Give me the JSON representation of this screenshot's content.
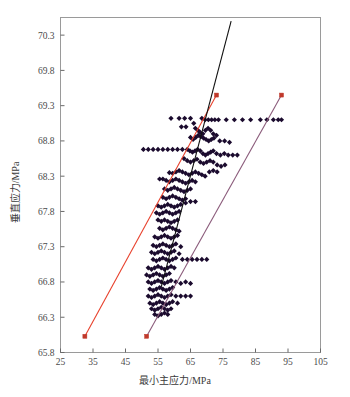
{
  "chart_data": {
    "type": "scatter",
    "title": "",
    "xlabel": "最小主应力/MPa",
    "ylabel": "垂直应力/MPa",
    "xlim": [
      25,
      105
    ],
    "ylim": [
      65.8,
      70.55
    ],
    "xticks": [
      25,
      35,
      45,
      55,
      65,
      75,
      85,
      95,
      105
    ],
    "yticks": [
      65.8,
      66.3,
      66.8,
      67.3,
      67.8,
      68.3,
      68.8,
      69.3,
      69.8,
      70.3
    ],
    "grid": false,
    "legend": "none",
    "marker": {
      "shape": "diamond",
      "color": "#1b0b2e",
      "size": 2.6
    },
    "series": [
      {
        "name": "散点数据",
        "type": "scatter",
        "color": "#1b0b2e",
        "points": [
          [
            59.0,
            69.12
          ],
          [
            61.5,
            69.12
          ],
          [
            63.2,
            69.12
          ],
          [
            65.0,
            69.12
          ],
          [
            68.5,
            69.12
          ],
          [
            62.2,
            69.0
          ],
          [
            63.6,
            69.0
          ],
          [
            66.0,
            69.05
          ],
          [
            69.5,
            69.1
          ],
          [
            70.5,
            69.1
          ],
          [
            71.5,
            69.1
          ],
          [
            72.5,
            69.1
          ],
          [
            73.6,
            69.1
          ],
          [
            76.0,
            69.1
          ],
          [
            78.5,
            69.1
          ],
          [
            81.0,
            69.1
          ],
          [
            83.5,
            69.1
          ],
          [
            86.5,
            69.1
          ],
          [
            88.5,
            69.1
          ],
          [
            90.5,
            69.1
          ],
          [
            92.0,
            69.1
          ],
          [
            93.0,
            69.1
          ],
          [
            66.5,
            68.98
          ],
          [
            67.3,
            68.95
          ],
          [
            68.0,
            68.92
          ],
          [
            68.8,
            68.9
          ],
          [
            69.6,
            68.95
          ],
          [
            70.4,
            68.98
          ],
          [
            71.2,
            68.95
          ],
          [
            72.0,
            68.9
          ],
          [
            73.0,
            68.88
          ],
          [
            65.0,
            68.85
          ],
          [
            65.8,
            68.82
          ],
          [
            66.6,
            68.85
          ],
          [
            67.4,
            68.88
          ],
          [
            68.2,
            68.86
          ],
          [
            69.0,
            68.84
          ],
          [
            69.8,
            68.82
          ],
          [
            70.6,
            68.8
          ],
          [
            71.4,
            68.82
          ],
          [
            72.2,
            68.84
          ],
          [
            74.0,
            68.8
          ],
          [
            75.5,
            68.8
          ],
          [
            77.0,
            68.78
          ],
          [
            50.5,
            68.68
          ],
          [
            52.0,
            68.68
          ],
          [
            53.5,
            68.68
          ],
          [
            55.0,
            68.68
          ],
          [
            56.5,
            68.68
          ],
          [
            58.0,
            68.68
          ],
          [
            59.5,
            68.68
          ],
          [
            61.0,
            68.68
          ],
          [
            62.5,
            68.68
          ],
          [
            64.0,
            68.68
          ],
          [
            64.8,
            68.66
          ],
          [
            65.6,
            68.64
          ],
          [
            66.4,
            68.66
          ],
          [
            67.2,
            68.68
          ],
          [
            68.0,
            68.66
          ],
          [
            68.8,
            68.62
          ],
          [
            69.6,
            68.6
          ],
          [
            70.4,
            68.62
          ],
          [
            71.2,
            68.64
          ],
          [
            72.0,
            68.66
          ],
          [
            73.0,
            68.62
          ],
          [
            74.2,
            68.6
          ],
          [
            75.4,
            68.62
          ],
          [
            76.6,
            68.6
          ],
          [
            78.0,
            68.6
          ],
          [
            79.4,
            68.6
          ],
          [
            63.0,
            68.55
          ],
          [
            64.0,
            68.52
          ],
          [
            65.0,
            68.5
          ],
          [
            66.0,
            68.52
          ],
          [
            67.0,
            68.54
          ],
          [
            68.0,
            68.5
          ],
          [
            69.0,
            68.48
          ],
          [
            70.0,
            68.5
          ],
          [
            71.0,
            68.52
          ],
          [
            72.0,
            68.5
          ],
          [
            73.2,
            68.46
          ],
          [
            74.4,
            68.44
          ],
          [
            75.6,
            68.46
          ],
          [
            58.5,
            68.35
          ],
          [
            59.5,
            68.34
          ],
          [
            60.5,
            68.36
          ],
          [
            61.5,
            68.38
          ],
          [
            62.5,
            68.36
          ],
          [
            63.5,
            68.34
          ],
          [
            64.5,
            68.32
          ],
          [
            65.5,
            68.34
          ],
          [
            66.5,
            68.36
          ],
          [
            67.5,
            68.34
          ],
          [
            68.5,
            68.32
          ],
          [
            69.5,
            68.3
          ],
          [
            70.8,
            68.36
          ],
          [
            72.0,
            68.38
          ],
          [
            73.2,
            68.36
          ],
          [
            55.5,
            68.26
          ],
          [
            56.5,
            68.26
          ],
          [
            57.5,
            68.24
          ],
          [
            58.5,
            68.22
          ],
          [
            59.5,
            68.24
          ],
          [
            60.5,
            68.26
          ],
          [
            61.5,
            68.24
          ],
          [
            62.5,
            68.22
          ],
          [
            63.5,
            68.2
          ],
          [
            64.5,
            68.22
          ],
          [
            65.5,
            68.24
          ],
          [
            66.5,
            68.22
          ],
          [
            57.0,
            68.12
          ],
          [
            58.0,
            68.1
          ],
          [
            59.0,
            68.12
          ],
          [
            60.0,
            68.14
          ],
          [
            61.0,
            68.12
          ],
          [
            62.0,
            68.1
          ],
          [
            63.0,
            68.08
          ],
          [
            64.0,
            68.1
          ],
          [
            65.0,
            68.12
          ],
          [
            56.5,
            68.0
          ],
          [
            57.5,
            67.98
          ],
          [
            58.5,
            68.0
          ],
          [
            59.5,
            68.02
          ],
          [
            60.5,
            68.0
          ],
          [
            61.5,
            67.98
          ],
          [
            62.5,
            67.96
          ],
          [
            63.5,
            67.98
          ],
          [
            55.0,
            67.88
          ],
          [
            56.0,
            67.86
          ],
          [
            57.0,
            67.88
          ],
          [
            58.0,
            67.9
          ],
          [
            59.0,
            67.88
          ],
          [
            60.0,
            67.86
          ],
          [
            61.0,
            67.88
          ],
          [
            62.0,
            67.9
          ],
          [
            63.5,
            67.92
          ],
          [
            65.0,
            67.94
          ],
          [
            66.5,
            67.94
          ],
          [
            54.5,
            67.78
          ],
          [
            55.5,
            67.76
          ],
          [
            56.5,
            67.78
          ],
          [
            57.5,
            67.8
          ],
          [
            58.5,
            67.78
          ],
          [
            59.5,
            67.76
          ],
          [
            60.5,
            67.78
          ],
          [
            61.5,
            67.8
          ],
          [
            55.0,
            67.68
          ],
          [
            56.0,
            67.66
          ],
          [
            57.0,
            67.68
          ],
          [
            58.0,
            67.66
          ],
          [
            59.0,
            67.64
          ],
          [
            60.0,
            67.66
          ],
          [
            61.0,
            67.68
          ],
          [
            55.5,
            67.56
          ],
          [
            56.5,
            67.54
          ],
          [
            57.5,
            67.56
          ],
          [
            58.5,
            67.58
          ],
          [
            59.5,
            67.56
          ],
          [
            60.5,
            67.54
          ],
          [
            61.5,
            67.52
          ],
          [
            54.0,
            67.44
          ],
          [
            55.0,
            67.42
          ],
          [
            56.0,
            67.44
          ],
          [
            57.0,
            67.46
          ],
          [
            58.0,
            67.44
          ],
          [
            59.0,
            67.42
          ],
          [
            60.0,
            67.44
          ],
          [
            61.0,
            67.46
          ],
          [
            53.5,
            67.32
          ],
          [
            54.5,
            67.3
          ],
          [
            55.5,
            67.32
          ],
          [
            56.5,
            67.34
          ],
          [
            57.5,
            67.32
          ],
          [
            58.5,
            67.3
          ],
          [
            59.5,
            67.32
          ],
          [
            60.5,
            67.34
          ],
          [
            62.0,
            67.3
          ],
          [
            53.0,
            67.22
          ],
          [
            54.0,
            67.2
          ],
          [
            55.0,
            67.22
          ],
          [
            56.0,
            67.24
          ],
          [
            57.0,
            67.22
          ],
          [
            58.0,
            67.2
          ],
          [
            59.0,
            67.22
          ],
          [
            60.0,
            67.24
          ],
          [
            61.5,
            67.2
          ],
          [
            53.5,
            67.12
          ],
          [
            54.5,
            67.1
          ],
          [
            55.5,
            67.12
          ],
          [
            56.5,
            67.14
          ],
          [
            57.5,
            67.12
          ],
          [
            58.5,
            67.1
          ],
          [
            59.5,
            67.12
          ],
          [
            60.5,
            67.14
          ],
          [
            62.5,
            67.12
          ],
          [
            64.0,
            67.12
          ],
          [
            65.5,
            67.12
          ],
          [
            67.0,
            67.12
          ],
          [
            68.5,
            67.12
          ],
          [
            70.0,
            67.12
          ],
          [
            52.0,
            67.0
          ],
          [
            53.0,
            66.98
          ],
          [
            54.0,
            67.0
          ],
          [
            55.0,
            67.02
          ],
          [
            56.0,
            67.0
          ],
          [
            57.0,
            66.98
          ],
          [
            58.0,
            67.0
          ],
          [
            59.0,
            67.02
          ],
          [
            60.0,
            67.0
          ],
          [
            51.5,
            66.9
          ],
          [
            52.5,
            66.88
          ],
          [
            53.5,
            66.9
          ],
          [
            54.5,
            66.92
          ],
          [
            55.5,
            66.9
          ],
          [
            56.5,
            66.88
          ],
          [
            57.5,
            66.9
          ],
          [
            58.5,
            66.92
          ],
          [
            52.0,
            66.8
          ],
          [
            53.0,
            66.78
          ],
          [
            54.0,
            66.8
          ],
          [
            55.0,
            66.82
          ],
          [
            56.0,
            66.8
          ],
          [
            57.0,
            66.78
          ],
          [
            58.0,
            66.8
          ],
          [
            59.0,
            66.82
          ],
          [
            60.5,
            66.8
          ],
          [
            62.0,
            66.78
          ],
          [
            63.5,
            66.8
          ],
          [
            65.0,
            66.78
          ],
          [
            52.5,
            66.7
          ],
          [
            53.5,
            66.68
          ],
          [
            54.5,
            66.7
          ],
          [
            55.5,
            66.72
          ],
          [
            56.5,
            66.7
          ],
          [
            57.5,
            66.68
          ],
          [
            58.5,
            66.7
          ],
          [
            59.5,
            66.72
          ],
          [
            52.0,
            66.6
          ],
          [
            53.0,
            66.58
          ],
          [
            54.0,
            66.6
          ],
          [
            55.0,
            66.62
          ],
          [
            56.0,
            66.6
          ],
          [
            57.0,
            66.58
          ],
          [
            58.0,
            66.6
          ],
          [
            59.0,
            66.62
          ],
          [
            60.5,
            66.6
          ],
          [
            62.0,
            66.6
          ],
          [
            63.5,
            66.6
          ],
          [
            65.0,
            66.6
          ],
          [
            52.5,
            66.5
          ],
          [
            53.5,
            66.48
          ],
          [
            54.5,
            66.5
          ],
          [
            55.5,
            66.52
          ],
          [
            56.5,
            66.5
          ],
          [
            57.5,
            66.48
          ],
          [
            58.5,
            66.5
          ],
          [
            59.5,
            66.52
          ],
          [
            61.0,
            66.5
          ],
          [
            53.0,
            66.42
          ],
          [
            54.0,
            66.4
          ],
          [
            55.0,
            66.42
          ],
          [
            56.0,
            66.44
          ],
          [
            57.0,
            66.42
          ],
          [
            58.0,
            66.4
          ],
          [
            59.0,
            66.42
          ],
          [
            54.0,
            66.34
          ],
          [
            55.0,
            66.32
          ],
          [
            56.0,
            66.34
          ],
          [
            57.0,
            66.36
          ],
          [
            58.0,
            66.34
          ]
        ]
      }
    ],
    "lines": [
      {
        "name": "红色下限拟合线",
        "color": "#e8412c",
        "endpoint_marker": "square",
        "endpoint_color": "#c0392b",
        "x": [
          32.5,
          73.0
        ],
        "y": [
          66.03,
          69.45
        ]
      },
      {
        "name": "黑色中心拟合线",
        "color": "#101010",
        "endpoint_marker": "none",
        "x": [
          56.0,
          77.5
        ],
        "y": [
          66.73,
          70.5
        ]
      },
      {
        "name": "紫色上限拟合线",
        "color": "#8a5a7a",
        "endpoint_marker": "square",
        "endpoint_color": "#c0392b",
        "x": [
          51.5,
          93.0
        ],
        "y": [
          66.03,
          69.45
        ]
      }
    ]
  },
  "figure": {
    "frame_color": "#9a9a9a",
    "background": "#ffffff",
    "tick_color": "#6a6a6a",
    "text_color": "#4a4a4a"
  }
}
